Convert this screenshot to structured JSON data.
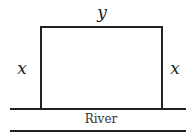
{
  "diagram": {
    "type": "rectangular-fence-along-river",
    "labels": {
      "top": "y",
      "left": "x",
      "right": "x",
      "river": "River"
    },
    "colors": {
      "stroke": "#222222",
      "background": "#ffffff",
      "text": "#222222"
    }
  }
}
